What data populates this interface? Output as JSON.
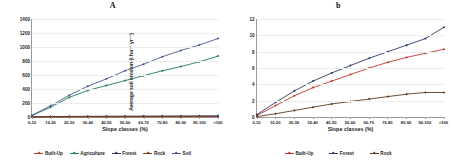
{
  "figure": {
    "panels": [
      {
        "title": "A",
        "xlabel": "Slope classes (%)",
        "ylabel": "Average soil erosion (t ha⁻¹ yr⁻¹)"
      },
      {
        "title": "b",
        "xlabel": "Slope classes (%)",
        "ylabel": "Average soil erosion (t ha⁻¹ yr⁻¹)"
      }
    ]
  },
  "chart_data": [
    {
      "type": "line",
      "title": "A",
      "xlabel": "Slope classes (%)",
      "ylabel": "Average soil erosion (t ha⁻¹ yr⁻¹)",
      "categories": [
        "0-10",
        "10-20",
        "20-30",
        "30-40",
        "40-50",
        "50-60",
        "60-70",
        "70-80",
        "80-90",
        "90-100",
        ">100"
      ],
      "ylim": [
        0,
        1400
      ],
      "yticks": [
        0,
        200,
        400,
        600,
        800,
        1000,
        1200,
        1400
      ],
      "grid": true,
      "legend_position": "bottom",
      "series": [
        {
          "name": "Built-Up",
          "color": "#c0392b",
          "values": [
            2,
            3,
            4,
            5,
            6,
            6,
            7,
            7,
            8,
            8,
            9
          ]
        },
        {
          "name": "Agriculture",
          "color": "#1f7a5a",
          "values": [
            20,
            140,
            280,
            380,
            450,
            520,
            590,
            660,
            720,
            790,
            870
          ]
        },
        {
          "name": "Forest",
          "color": "#2b3a67",
          "values": [
            4,
            6,
            8,
            10,
            11,
            12,
            13,
            14,
            15,
            16,
            17
          ]
        },
        {
          "name": "Rock",
          "color": "#7a3b1e",
          "values": [
            1,
            2,
            2,
            3,
            3,
            4,
            4,
            5,
            5,
            6,
            6
          ]
        },
        {
          "name": "Soil",
          "color": "#4a5a8a",
          "values": [
            25,
            160,
            310,
            440,
            545,
            660,
            755,
            860,
            950,
            1030,
            1120
          ]
        }
      ]
    },
    {
      "type": "line",
      "title": "b",
      "xlabel": "Slope classes (%)",
      "ylabel": "Average soil erosion (t ha⁻¹ yr⁻¹)",
      "categories": [
        "0-10",
        "10-20",
        "20-30",
        "30-40",
        "40-50",
        "50-60",
        "60-70",
        "70-80",
        "80-90",
        "90-100",
        ">100"
      ],
      "ylim": [
        0,
        12
      ],
      "yticks": [
        0,
        2,
        4,
        6,
        8,
        10,
        12
      ],
      "grid": true,
      "legend_position": "bottom",
      "series": [
        {
          "name": "Built-Up",
          "color": "#c0392b",
          "values": [
            0.2,
            1.4,
            2.6,
            3.6,
            4.4,
            5.2,
            6.0,
            6.7,
            7.3,
            7.8,
            8.3
          ]
        },
        {
          "name": "Forest",
          "color": "#2b3a67",
          "values": [
            0.3,
            1.8,
            3.2,
            4.4,
            5.4,
            6.3,
            7.2,
            8.0,
            8.8,
            9.6,
            11.0
          ]
        },
        {
          "name": "Rock",
          "color": "#5a3a1e",
          "values": [
            0.05,
            0.4,
            0.8,
            1.2,
            1.6,
            1.9,
            2.2,
            2.5,
            2.8,
            3.0,
            3.0
          ]
        }
      ]
    }
  ]
}
